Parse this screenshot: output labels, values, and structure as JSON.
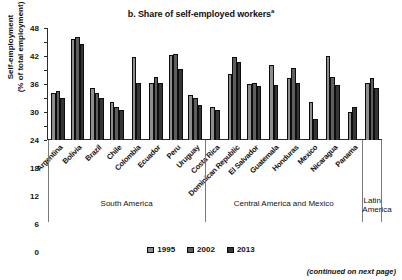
{
  "chart_data": {
    "type": "bar",
    "title": "b. Share of self-employed workers",
    "title_superscript": "a",
    "ylabel": "Self-employment\n(% of total employment)",
    "ylabel_line1": "Self-employment",
    "ylabel_line2": "(% of total employment)",
    "xlabel": "",
    "ylim": [
      0,
      48
    ],
    "yticks": [
      0,
      6,
      12,
      18,
      24,
      30,
      36,
      42,
      48
    ],
    "grid": false,
    "legend_position": "bottom-center",
    "categories": [
      "Argentina",
      "Bolivia",
      "Brazil",
      "Chile",
      "Colombia",
      "Ecuador",
      "Peru",
      "Uruguay",
      "Costa Rica",
      "Dominican Republic",
      "El Salvador",
      "Guatemala",
      "Honduras",
      "Mexico",
      "Nicaragua",
      "Panama",
      "Latin America"
    ],
    "series": [
      {
        "name": "1995",
        "color": "#8e8e8e",
        "values": [
          20.0,
          43.5,
          22.5,
          16.5,
          35.5,
          24.5,
          36.5,
          19.5,
          14.0,
          28.5,
          24.0,
          32.0,
          26.5,
          16.5,
          36.0,
          12.0,
          24.5
        ]
      },
      {
        "name": "2002",
        "color": "#5e5e5e",
        "values": [
          21.0,
          44.0,
          20.0,
          14.0,
          37.5,
          27.0,
          37.0,
          18.0,
          13.5,
          35.5,
          24.5,
          23.5,
          31.0,
          9.0,
          27.0,
          14.0,
          26.5
        ]
      },
      {
        "name": "2013",
        "color": "#353535",
        "values": [
          18.0,
          41.0,
          18.0,
          13.0,
          24.5,
          24.5,
          30.5,
          15.0,
          13.0,
          33.5,
          23.0,
          23.5,
          24.5,
          9.0,
          23.5,
          14.0,
          22.5
        ]
      }
    ],
    "bars_per_category": [
      3,
      3,
      3,
      3,
      2,
      3,
      3,
      3,
      2,
      3,
      3,
      2,
      3,
      2,
      3,
      2,
      3
    ],
    "regions": [
      {
        "label": "South America",
        "start_index": 0,
        "end_index": 7
      },
      {
        "label": "Central America and Mexico",
        "start_index": 8,
        "end_index": 15
      },
      {
        "label": "Latin\nAmerica",
        "label_line1": "Latin",
        "label_line2": "America",
        "start_index": 16,
        "end_index": 16
      }
    ],
    "legend": [
      {
        "label": "1995",
        "color": "#8e8e8e"
      },
      {
        "label": "2002",
        "color": "#5e5e5e"
      },
      {
        "label": "2013",
        "color": "#353535"
      }
    ],
    "footnote": "(continued on next page)"
  }
}
